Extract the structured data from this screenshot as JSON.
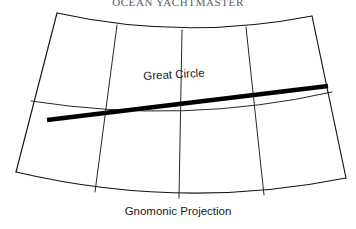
{
  "header": {
    "title": "OCEAN YACHTMASTER"
  },
  "figure": {
    "caption": "Gnomonic Projection",
    "great_circle_label": "Great Circle"
  },
  "colors": {
    "background": "#ffffff",
    "grid_stroke": "#141414",
    "great_circle_stroke": "#000000",
    "caption_text": "#1a1a1a",
    "header_text": "#5b5b5b"
  },
  "chart_data": {
    "type": "line",
    "title": "Gnomonic Projection",
    "subtitle": "OCEAN YACHTMASTER",
    "xlabel": "",
    "ylabel": "",
    "grid": true,
    "legend": "none",
    "annotations": [
      {
        "text": "Great Circle",
        "x": 143,
        "y": 70,
        "rotation": -3.2
      },
      {
        "text": "Gnomonic Projection",
        "x": 178,
        "y": 214,
        "rotation": 0
      }
    ],
    "viewbox": [
      0,
      0,
      356,
      229
    ],
    "graticule": {
      "corners": {
        "top_left": [
          57,
          13
        ],
        "top_right": [
          312,
          16
        ],
        "bottom_left": [
          16,
          172
        ],
        "bottom_right": [
          346,
          178
        ]
      },
      "meridians": [
        {
          "name": "left-edge",
          "path": "M 57,13 L 16,172"
        },
        {
          "name": "meridian-1",
          "path": "M 117,25 L 95,192"
        },
        {
          "name": "meridian-2",
          "path": "M 182,30 L 179,198"
        },
        {
          "name": "meridian-3",
          "path": "M 246,27 L 264,195"
        },
        {
          "name": "right-edge",
          "path": "M 312,16 L 346,178"
        }
      ],
      "parallels": [
        {
          "name": "parallel-top",
          "path": "M 57,13 Q 184,41 312,16"
        },
        {
          "name": "parallel-middle",
          "path": "M 31,101 Q 186,125 332,92"
        },
        {
          "name": "parallel-bottom",
          "path": "M 16,172 Q 182,211 346,178"
        }
      ],
      "great_circle": {
        "name": "great-circle",
        "path": "M 47,120 L 328,86",
        "start": [
          47,
          120
        ],
        "end": [
          328,
          86
        ],
        "stroke_width": 4.4
      }
    }
  }
}
